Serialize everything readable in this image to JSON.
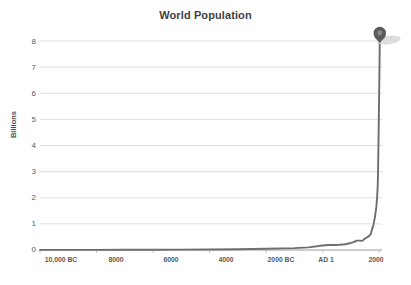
{
  "chart_data": {
    "type": "line",
    "title": "World Population",
    "xlabel": "",
    "ylabel": "Billions",
    "ylim": [
      0,
      8
    ],
    "xlim": [
      -10000,
      2100
    ],
    "grid": true,
    "legend": false,
    "y_ticks": [
      "0",
      "1",
      "2",
      "3",
      "4",
      "5",
      "6",
      "7",
      "8"
    ],
    "y_tick_values": [
      0,
      1,
      2,
      3,
      4,
      5,
      6,
      7,
      8
    ],
    "x_ticks": [
      "10,000 BC",
      "8000",
      "6000",
      "4000",
      "2000 BC",
      "AD 1",
      "2000"
    ],
    "x_tick_values": [
      -10000,
      -8000,
      -6000,
      -4000,
      -2000,
      1,
      2000
    ],
    "series": [
      {
        "name": "World Population",
        "color": "#6e6e6e",
        "x": [
          -10000,
          -9000,
          -8000,
          -7000,
          -6000,
          -5000,
          -4000,
          -3000,
          -2000,
          -1000,
          -500,
          1,
          200,
          400,
          600,
          800,
          1000,
          1100,
          1200,
          1300,
          1400,
          1500,
          1600,
          1700,
          1750,
          1800,
          1850,
          1900,
          1927,
          1950,
          1960,
          1974,
          1987,
          1999,
          2011,
          2022
        ],
        "y": [
          0.004,
          0.005,
          0.005,
          0.007,
          0.01,
          0.015,
          0.02,
          0.03,
          0.05,
          0.07,
          0.1,
          0.17,
          0.19,
          0.19,
          0.2,
          0.22,
          0.27,
          0.3,
          0.36,
          0.36,
          0.35,
          0.44,
          0.5,
          0.6,
          0.79,
          0.98,
          1.26,
          1.65,
          2.0,
          2.5,
          3.0,
          4.0,
          5.0,
          6.0,
          7.0,
          8.0
        ]
      }
    ],
    "annotations": [
      {
        "name": "endpoint-marker",
        "icon": "map-pin-icon",
        "x": 2022,
        "y": 8.0,
        "color": "#5c5c5c",
        "inner_color": "#8a8a8a"
      }
    ],
    "colors": {
      "line": "#6e6e6e",
      "grid": "#d6d6d6",
      "axis_text": "#5a5a5a",
      "title_text": "#3f3f3f",
      "marker": "#5c5c5c",
      "marker_shadow": "#dcdcdc",
      "background": "#ffffff"
    }
  }
}
